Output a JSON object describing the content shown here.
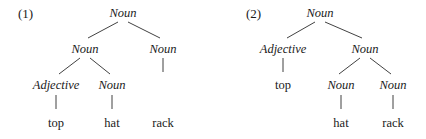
{
  "page": {
    "background_color": "#ffffff",
    "text_color": "#1a1a1a",
    "line_color": "#2b2b2b",
    "width": 426,
    "height": 139
  },
  "trees": [
    {
      "id": "tree-1",
      "label": "(1)",
      "label_x": 18,
      "label_y": 7,
      "nodes": [
        {
          "name": "root",
          "text": "Noun",
          "style": "cat",
          "x": 123,
          "y": 6
        },
        {
          "name": "n-left",
          "text": "Noun",
          "style": "cat",
          "x": 85,
          "y": 42
        },
        {
          "name": "n-right",
          "text": "Noun",
          "style": "cat",
          "x": 163,
          "y": 42
        },
        {
          "name": "adj",
          "text": "Adjective",
          "style": "cat",
          "x": 56,
          "y": 78
        },
        {
          "name": "n-inner",
          "text": "Noun",
          "style": "cat",
          "x": 112,
          "y": 78
        },
        {
          "name": "leaf-rack",
          "text": "rack",
          "style": "leaf",
          "x": 163,
          "y": 116
        },
        {
          "name": "leaf-top",
          "text": "top",
          "style": "leaf",
          "x": 56,
          "y": 116
        },
        {
          "name": "leaf-hat",
          "text": "hat",
          "style": "leaf",
          "x": 112,
          "y": 116
        }
      ],
      "edges": [
        {
          "name": "root-to-left",
          "x1": 118,
          "y1": 22,
          "x2": 88,
          "y2": 38
        },
        {
          "name": "root-to-right",
          "x1": 128,
          "y1": 22,
          "x2": 160,
          "y2": 38
        },
        {
          "name": "left-to-adj",
          "x1": 80,
          "y1": 58,
          "x2": 59,
          "y2": 74
        },
        {
          "name": "left-to-ninner",
          "x1": 90,
          "y1": 58,
          "x2": 110,
          "y2": 74
        },
        {
          "name": "right-to-rack",
          "x1": 163,
          "y1": 58,
          "x2": 163,
          "y2": 72
        },
        {
          "name": "adj-to-top",
          "x1": 56,
          "y1": 95,
          "x2": 56,
          "y2": 109
        },
        {
          "name": "ninner-to-hat",
          "x1": 112,
          "y1": 95,
          "x2": 112,
          "y2": 109
        }
      ]
    },
    {
      "id": "tree-2",
      "label": "(2)",
      "label_x": 33,
      "label_y": 7,
      "nodes": [
        {
          "name": "root",
          "text": "Noun",
          "style": "cat",
          "x": 107,
          "y": 6
        },
        {
          "name": "adj",
          "text": "Adjective",
          "style": "cat",
          "x": 70,
          "y": 42
        },
        {
          "name": "n-right",
          "text": "Noun",
          "style": "cat",
          "x": 152,
          "y": 42
        },
        {
          "name": "leaf-top",
          "text": "top",
          "style": "leaf",
          "x": 70,
          "y": 78
        },
        {
          "name": "n-left2",
          "text": "Noun",
          "style": "cat",
          "x": 128,
          "y": 78
        },
        {
          "name": "n-right2",
          "text": "Noun",
          "style": "cat",
          "x": 180,
          "y": 78
        },
        {
          "name": "leaf-hat",
          "text": "hat",
          "style": "leaf",
          "x": 128,
          "y": 116
        },
        {
          "name": "leaf-rack",
          "text": "rack",
          "style": "leaf",
          "x": 180,
          "y": 116
        }
      ],
      "edges": [
        {
          "name": "root-to-adj",
          "x1": 102,
          "y1": 22,
          "x2": 74,
          "y2": 38
        },
        {
          "name": "root-to-nright",
          "x1": 112,
          "y1": 22,
          "x2": 149,
          "y2": 38
        },
        {
          "name": "adj-to-top",
          "x1": 70,
          "y1": 58,
          "x2": 70,
          "y2": 72
        },
        {
          "name": "nright-to-left2",
          "x1": 147,
          "y1": 58,
          "x2": 126,
          "y2": 74
        },
        {
          "name": "nright-to-right2",
          "x1": 157,
          "y1": 58,
          "x2": 178,
          "y2": 74
        },
        {
          "name": "nleft2-to-hat",
          "x1": 128,
          "y1": 95,
          "x2": 128,
          "y2": 109
        },
        {
          "name": "nright2-to-rack",
          "x1": 180,
          "y1": 95,
          "x2": 180,
          "y2": 109
        }
      ]
    }
  ]
}
